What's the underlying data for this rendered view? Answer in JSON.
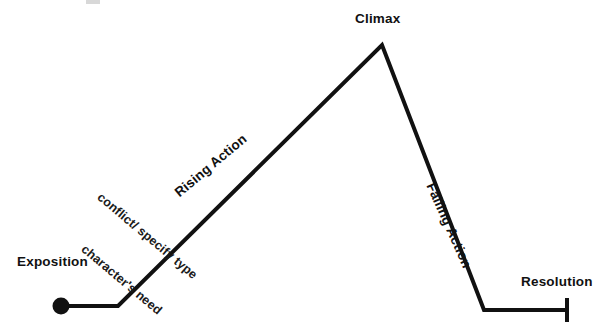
{
  "diagram": {
    "background_color": "#ffffff",
    "line_color": "#111111",
    "line_width": 4,
    "labels": {
      "exposition": "Exposition",
      "climax": "Climax",
      "resolution": "Resolution",
      "rising_action": "Rising Action",
      "falling_action": "Falling Action",
      "conflict_note": "conflict/ specify type",
      "character_need_note": "character's need"
    }
  },
  "chart_data": {
    "type": "line",
    "xlabel": "",
    "ylabel": "",
    "grid": false,
    "legend": null,
    "series": [
      {
        "name": "Story Arc",
        "points": [
          {
            "x": 61,
            "y": 306,
            "stage": "Exposition",
            "marker": "filled-circle"
          },
          {
            "x": 118,
            "y": 306,
            "stage": "Exposition end / Rising Action start",
            "marker": "none"
          },
          {
            "x": 382,
            "y": 45,
            "stage": "Climax",
            "marker": "none"
          },
          {
            "x": 484,
            "y": 310,
            "stage": "Falling Action end",
            "marker": "none"
          },
          {
            "x": 568,
            "y": 310,
            "stage": "Resolution",
            "marker": "vertical-tick"
          }
        ]
      }
    ],
    "annotations": [
      {
        "text": "Exposition",
        "x": 17,
        "y": 255,
        "rotation": 0,
        "bold": true
      },
      {
        "text": "character's need",
        "x": 79,
        "y": 240,
        "rotation": 40,
        "bold": false
      },
      {
        "text": "conflict/ specify type",
        "x": 95,
        "y": 188,
        "rotation": 40,
        "bold": false
      },
      {
        "text": "Rising Action",
        "x": 181,
        "y": 186,
        "rotation": -40,
        "bold": true
      },
      {
        "text": "Climax",
        "x": 355,
        "y": 12,
        "rotation": 0,
        "bold": true
      },
      {
        "text": "Falling Action",
        "x": 424,
        "y": 173,
        "rotation": 66,
        "bold": true
      },
      {
        "text": "Resolution",
        "x": 521,
        "y": 275,
        "rotation": 0,
        "bold": true
      }
    ],
    "xlim": [
      0,
      614
    ],
    "ylim": [
      334,
      0
    ]
  }
}
